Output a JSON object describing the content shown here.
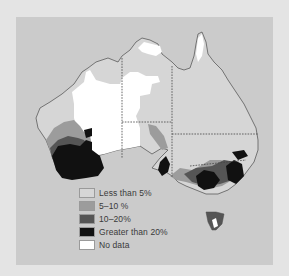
{
  "map": {
    "subject": "Australia",
    "colors": {
      "outer_background": "#e4e4e4",
      "panel_background": "#cbcbcb",
      "land": "#d6d6d6",
      "border": "#555555"
    }
  },
  "legend": {
    "items": [
      {
        "label": "Less than 5%",
        "color": "#d6d6d6"
      },
      {
        "label": "5–10 %",
        "color": "#9c9c9c"
      },
      {
        "label": "10–20%",
        "color": "#555555"
      },
      {
        "label": "Greater than 20%",
        "color": "#111111"
      },
      {
        "label": "No data",
        "color": "#ffffff"
      }
    ]
  }
}
